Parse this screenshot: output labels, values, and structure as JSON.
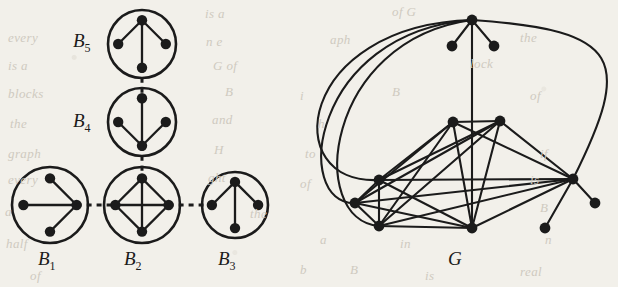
{
  "figure": {
    "caption_labels": [
      {
        "id": "B1",
        "text": "B",
        "sub": "1",
        "x": 38,
        "y": 248
      },
      {
        "id": "B2",
        "text": "B",
        "sub": "2",
        "x": 124,
        "y": 248
      },
      {
        "id": "B3",
        "text": "B",
        "sub": "3",
        "x": 218,
        "y": 248
      },
      {
        "id": "B4",
        "text": "B",
        "sub": "4",
        "x": 73,
        "y": 110
      },
      {
        "id": "B5",
        "text": "B",
        "sub": "5",
        "x": 73,
        "y": 30
      },
      {
        "id": "G",
        "text": "G",
        "sub": "",
        "x": 448,
        "y": 248
      }
    ],
    "ghost_text": [
      {
        "text": "is a",
        "x": 205,
        "y": 6
      },
      {
        "text": "of G",
        "x": 392,
        "y": 4
      },
      {
        "text": "every",
        "x": 8,
        "y": 30
      },
      {
        "text": "n e",
        "x": 206,
        "y": 34
      },
      {
        "text": "aph",
        "x": 330,
        "y": 32
      },
      {
        "text": "the",
        "x": 520,
        "y": 30
      },
      {
        "text": "is a",
        "x": 8,
        "y": 58
      },
      {
        "text": "G of",
        "x": 213,
        "y": 58
      },
      {
        "text": "lock",
        "x": 470,
        "y": 56
      },
      {
        "text": "blocks",
        "x": 8,
        "y": 86
      },
      {
        "text": "B",
        "x": 225,
        "y": 84
      },
      {
        "text": "i",
        "x": 300,
        "y": 88
      },
      {
        "text": "B",
        "x": 392,
        "y": 84
      },
      {
        "text": "of",
        "x": 530,
        "y": 88
      },
      {
        "text": "the",
        "x": 10,
        "y": 116
      },
      {
        "text": "and",
        "x": 212,
        "y": 112
      },
      {
        "text": "h",
        "x": 318,
        "y": 116
      },
      {
        "text": "graph",
        "x": 8,
        "y": 146
      },
      {
        "text": "H",
        "x": 214,
        "y": 142
      },
      {
        "text": "to",
        "x": 305,
        "y": 146
      },
      {
        "text": "if",
        "x": 540,
        "y": 146
      },
      {
        "text": "every",
        "x": 8,
        "y": 172
      },
      {
        "text": "ght",
        "x": 208,
        "y": 170
      },
      {
        "text": "of",
        "x": 300,
        "y": 176
      },
      {
        "text": "is",
        "x": 530,
        "y": 172
      },
      {
        "text": "a",
        "x": 5,
        "y": 204
      },
      {
        "text": "the",
        "x": 250,
        "y": 206
      },
      {
        "text": "B",
        "x": 540,
        "y": 200
      },
      {
        "text": "half",
        "x": 6,
        "y": 236
      },
      {
        "text": "a",
        "x": 320,
        "y": 232
      },
      {
        "text": "in",
        "x": 400,
        "y": 236
      },
      {
        "text": "n",
        "x": 545,
        "y": 232
      },
      {
        "text": "of",
        "x": 30,
        "y": 268
      },
      {
        "text": "b",
        "x": 300,
        "y": 262
      },
      {
        "text": "B",
        "x": 350,
        "y": 262
      },
      {
        "text": "is",
        "x": 425,
        "y": 268
      },
      {
        "text": "real",
        "x": 520,
        "y": 264
      }
    ],
    "blocks": [
      {
        "id": "B1",
        "cx": 50,
        "cy": 205,
        "r": 38,
        "nodes": [
          {
            "x": 50,
            "y": 205,
            "type": "center-left"
          }
        ]
      },
      {
        "id": "B2",
        "cx": 142,
        "cy": 205,
        "r": 38
      },
      {
        "id": "B3",
        "cx": 235,
        "cy": 205,
        "r": 33
      },
      {
        "id": "B4",
        "cx": 142,
        "cy": 122,
        "r": 34
      },
      {
        "id": "B5",
        "cx": 142,
        "cy": 44,
        "r": 34
      }
    ],
    "block_structure": {
      "B1": {
        "shape": "star",
        "hub": "right",
        "leaves": [
          "top",
          "left",
          "bottom"
        ]
      },
      "B2": {
        "shape": "complete-K4",
        "nodes": [
          "top",
          "left",
          "right",
          "bottom"
        ]
      },
      "B3": {
        "shape": "star",
        "hub": "top",
        "leaves": [
          "left",
          "right",
          "bottom"
        ]
      },
      "B4": {
        "shape": "star",
        "hub": "bottom",
        "leaves": [
          "top",
          "left",
          "right"
        ]
      },
      "B5": {
        "shape": "star",
        "hub": "top",
        "leaves": [
          "left",
          "right",
          "bottom"
        ]
      }
    },
    "connectors": [
      {
        "from": "B1",
        "to": "B2",
        "style": "dashed",
        "orientation": "horizontal"
      },
      {
        "from": "B2",
        "to": "B3",
        "style": "dashed",
        "orientation": "horizontal"
      },
      {
        "from": "B2",
        "to": "B4",
        "style": "dashed",
        "orientation": "vertical"
      },
      {
        "from": "B4",
        "to": "B5",
        "style": "dashed",
        "orientation": "vertical"
      }
    ],
    "graph_G": {
      "label": "G",
      "vertices": [
        {
          "id": "t",
          "x": 472,
          "y": 20
        },
        {
          "id": "p1",
          "x": 452,
          "y": 46
        },
        {
          "id": "p2",
          "x": 494,
          "y": 46
        },
        {
          "id": "a",
          "x": 453,
          "y": 122
        },
        {
          "id": "b",
          "x": 500,
          "y": 121
        },
        {
          "id": "c",
          "x": 379,
          "y": 180
        },
        {
          "id": "d",
          "x": 355,
          "y": 203
        },
        {
          "id": "e",
          "x": 379,
          "y": 226
        },
        {
          "id": "f",
          "x": 472,
          "y": 228
        },
        {
          "id": "g",
          "x": 573,
          "y": 179
        },
        {
          "id": "h",
          "x": 595,
          "y": 203
        },
        {
          "id": "i",
          "x": 545,
          "y": 228
        }
      ],
      "straight_edges": [
        [
          "t",
          "p1"
        ],
        [
          "t",
          "p2"
        ],
        [
          "t",
          "f"
        ],
        [
          "a",
          "b"
        ],
        [
          "a",
          "c"
        ],
        [
          "a",
          "d"
        ],
        [
          "a",
          "e"
        ],
        [
          "a",
          "f"
        ],
        [
          "a",
          "g"
        ],
        [
          "b",
          "c"
        ],
        [
          "b",
          "d"
        ],
        [
          "b",
          "e"
        ],
        [
          "b",
          "f"
        ],
        [
          "b",
          "g"
        ],
        [
          "c",
          "d"
        ],
        [
          "c",
          "e"
        ],
        [
          "c",
          "f"
        ],
        [
          "c",
          "g"
        ],
        [
          "d",
          "e"
        ],
        [
          "d",
          "f"
        ],
        [
          "d",
          "g"
        ],
        [
          "e",
          "f"
        ],
        [
          "e",
          "g"
        ],
        [
          "f",
          "g"
        ],
        [
          "g",
          "h"
        ],
        [
          "g",
          "i"
        ]
      ],
      "curved_edges": [
        {
          "from": "t",
          "to": "c",
          "bow": "left-outer"
        },
        {
          "from": "t",
          "to": "d",
          "bow": "left-mid"
        },
        {
          "from": "t",
          "to": "e",
          "bow": "left-inner"
        },
        {
          "from": "t",
          "to": "g",
          "bow": "right-outer"
        }
      ]
    },
    "style": {
      "ink": "#1b1b1b",
      "paper": "#f2f0ea",
      "node_radius": 5,
      "edge_width": 2,
      "circle_width": 2.6
    }
  }
}
